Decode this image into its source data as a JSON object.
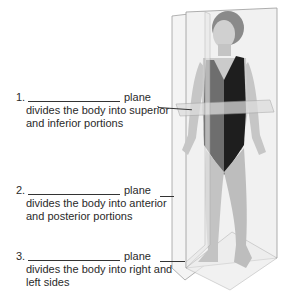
{
  "labels": [
    {
      "number": "1.",
      "suffix": "plane",
      "description": "divides the body into superior and inferior portions"
    },
    {
      "number": "2.",
      "suffix": "plane",
      "description": "divides the body into anterior and posterior portions"
    },
    {
      "number": "3.",
      "suffix": "plane",
      "description": "divides the body into right and left sides"
    }
  ],
  "figure": {
    "colors": {
      "plane_fill": "#f0f0f0",
      "plane_edge": "#9a9a9a",
      "skin": "#c9c9c9",
      "suit_dark": "#1e1e1e",
      "suit_mid": "#6e6e6e",
      "hair": "#8a8a8a"
    }
  }
}
